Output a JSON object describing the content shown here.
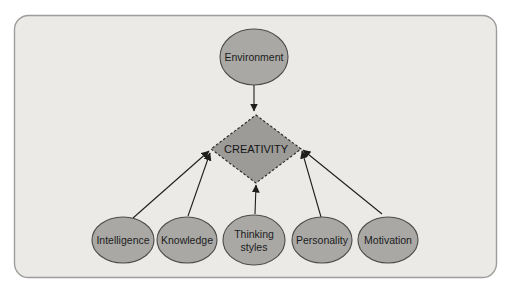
{
  "colors": {
    "panel_bg": "#ebeae7",
    "panel_border": "#9d9d9b",
    "node_fill": "#a9a8a5",
    "node_border": "#4b4b49",
    "diamond_fill": "#9c9b98",
    "arrow": "#1e1e1c",
    "text": "#1c1c1c"
  },
  "diagram": {
    "center_node": {
      "label": "CREATIVITY",
      "shape": "diamond"
    },
    "top_node": {
      "label": "Environment",
      "shape": "ellipse"
    },
    "bottom_nodes": [
      {
        "label": "Intelligence"
      },
      {
        "label": "Knowledge"
      },
      {
        "label": "Thinking",
        "label2": "styles"
      },
      {
        "label": "Personality"
      },
      {
        "label": "Motivation"
      }
    ],
    "edges": [
      {
        "from": "Environment",
        "to": "CREATIVITY"
      },
      {
        "from": "Intelligence",
        "to": "CREATIVITY"
      },
      {
        "from": "Knowledge",
        "to": "CREATIVITY"
      },
      {
        "from": "Thinking styles",
        "to": "CREATIVITY"
      },
      {
        "from": "Personality",
        "to": "CREATIVITY"
      },
      {
        "from": "Motivation",
        "to": "CREATIVITY"
      }
    ]
  }
}
